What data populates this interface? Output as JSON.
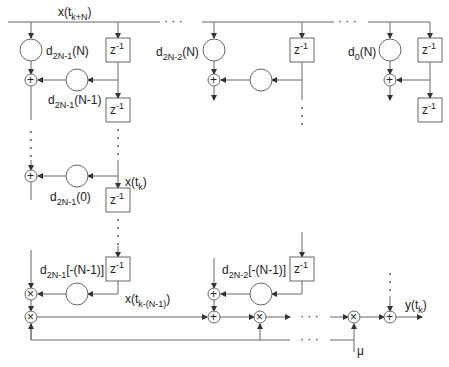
{
  "diagram": {
    "type": "block-diagram",
    "input_label": {
      "base": "x(t",
      "sub": "k+N",
      "close": ")"
    },
    "delay_label": {
      "base": "z",
      "sup": "-1"
    },
    "ellipsis": "· · ·",
    "coefficients": {
      "d_2N1_N": {
        "base": "d",
        "sub": "2N-1",
        "arg": "(N)"
      },
      "d_2N1_N1": {
        "base": "d",
        "sub": "2N-1",
        "arg": "(N-1)"
      },
      "d_2N1_0": {
        "base": "d",
        "sub": "2N-1",
        "arg": "(0)"
      },
      "d_2N1_neg": {
        "base": "d",
        "sub": "2N-1",
        "arg": "[-(N-1)]"
      },
      "d_2N2_N": {
        "base": "d",
        "sub": "2N-2",
        "arg": "(N)"
      },
      "d_2N2_neg": {
        "base": "d",
        "sub": "2N-2",
        "arg": "[-(N-1)]"
      },
      "d_0_N": {
        "base": "d",
        "sub": "0",
        "arg": "(N)"
      }
    },
    "signals": {
      "x_tk": {
        "base": "x(t",
        "sub": "k",
        "close": ")"
      },
      "x_tkN1": {
        "base": "x(t",
        "sub": "k-(N-1)",
        "close": ")"
      },
      "y_tk": {
        "base": "y(t",
        "sub": "k",
        "close": ")"
      },
      "mu": "μ"
    },
    "operators": {
      "add": "+",
      "multiply": "×"
    }
  }
}
